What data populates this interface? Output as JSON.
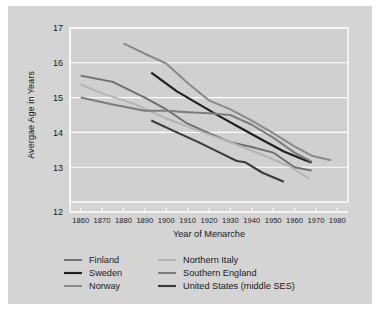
{
  "chart_data": {
    "type": "line",
    "title": "",
    "xlabel": "Year of Menarche",
    "ylabel": "Avergae Age in Years",
    "xlim": [
      1855,
      1985
    ],
    "ylim": [
      12,
      17
    ],
    "xticks": [
      1860,
      1870,
      1880,
      1890,
      1900,
      1910,
      1920,
      1930,
      1940,
      1950,
      1960,
      1970,
      1980
    ],
    "yticks": [
      12,
      13,
      14,
      15,
      16,
      17
    ],
    "grid": "horizontal",
    "legend_position": "below-axes",
    "background_color": "#d4d4d4",
    "plot_background_color": "#d0d0d0",
    "gridline_color": "#ffffff",
    "series": [
      {
        "name": "Finland",
        "color": "#6e6e6e",
        "width": 1.9,
        "x": [
          1860,
          1875,
          1890,
          1900,
          1910,
          1920,
          1930,
          1940,
          1950,
          1960,
          1968
        ],
        "y": [
          15.63,
          15.45,
          15.0,
          14.66,
          14.25,
          13.98,
          13.72,
          13.58,
          13.42,
          13.0,
          12.9
        ]
      },
      {
        "name": "Sweden",
        "color": "#202020",
        "width": 2.2,
        "x": [
          1893,
          1905,
          1915,
          1925,
          1935,
          1945,
          1955,
          1965,
          1968
        ],
        "y": [
          15.72,
          15.18,
          14.82,
          14.46,
          14.12,
          13.78,
          13.45,
          13.2,
          13.14
        ]
      },
      {
        "name": "Norway",
        "color": "#8a8a8a",
        "width": 2.0,
        "x": [
          1880,
          1890,
          1900,
          1910,
          1920,
          1930,
          1940,
          1950,
          1960,
          1968,
          1977
        ],
        "y": [
          16.56,
          16.26,
          15.98,
          15.42,
          14.92,
          14.66,
          14.34,
          13.98,
          13.6,
          13.33,
          13.2
        ]
      },
      {
        "name": "Northern Italy",
        "color": "#b4b4b4",
        "width": 2.0,
        "x": [
          1860,
          1870,
          1885,
          1900,
          1915,
          1930,
          1945,
          1958,
          1967
        ],
        "y": [
          15.38,
          15.12,
          14.82,
          14.4,
          14.05,
          13.72,
          13.35,
          13.02,
          12.66
        ]
      },
      {
        "name": "Southern England",
        "color": "#7c7c7c",
        "width": 2.0,
        "x": [
          1860,
          1875,
          1890,
          1900,
          1910,
          1920,
          1930,
          1940,
          1950,
          1960,
          1968
        ],
        "y": [
          15.0,
          14.8,
          14.62,
          14.62,
          14.58,
          14.55,
          14.5,
          14.22,
          13.85,
          13.42,
          13.16
        ]
      },
      {
        "name": "United States (middle SES)",
        "color": "#3a3a3a",
        "width": 2.1,
        "x": [
          1893,
          1905,
          1915,
          1925,
          1933,
          1937,
          1945,
          1955
        ],
        "y": [
          14.34,
          14.0,
          13.72,
          13.42,
          13.18,
          13.14,
          12.84,
          12.58
        ]
      }
    ]
  },
  "legend": {
    "entries": [
      {
        "label": "Finland",
        "color": "#6e6e6e"
      },
      {
        "label": "Sweden",
        "color": "#202020"
      },
      {
        "label": "Norway",
        "color": "#8a8a8a"
      },
      {
        "label": "Northern Italy",
        "color": "#b4b4b4"
      },
      {
        "label": "Southern England",
        "color": "#7c7c7c"
      },
      {
        "label": "United States (middle SES)",
        "color": "#3a3a3a"
      }
    ]
  }
}
